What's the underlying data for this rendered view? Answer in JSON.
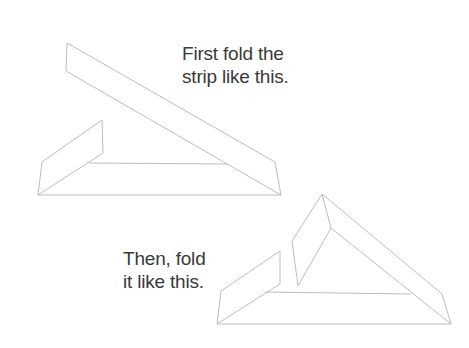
{
  "figures": [
    {
      "caption_lines": [
        "First fold the",
        "strip like this."
      ],
      "description": "Strip folded once into a sloped triangle"
    },
    {
      "caption_lines": [
        "Then, fold",
        "it like this."
      ],
      "description": "Strip folded twice forming a triangle with an upright flap"
    }
  ],
  "colors": {
    "line": "#bdbdbd",
    "text": "#3a3a3a",
    "background": "#ffffff"
  }
}
